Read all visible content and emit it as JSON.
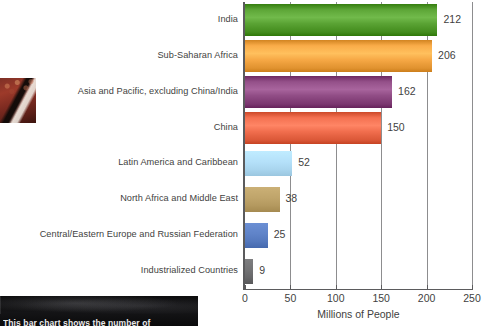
{
  "chart_data": {
    "type": "bar",
    "orientation": "horizontal",
    "title": "",
    "xlabel": "Millions of People",
    "ylabel": "",
    "xlim": [
      0,
      250
    ],
    "xticks": [
      0,
      50,
      100,
      150,
      200,
      250
    ],
    "grid": "vertical",
    "legend": "none",
    "categories": [
      "India",
      "Sub-Saharan Africa",
      "Asia and Pacific, excluding China/India",
      "China",
      "Latin America and Caribbean",
      "North Africa and Middle East",
      "Central/Eastern Europe and Russian Federation",
      "Industrialized Countries"
    ],
    "values": [
      212,
      206,
      162,
      150,
      52,
      38,
      25,
      9
    ],
    "value_labels": [
      "212",
      "206",
      "162",
      "150",
      "52",
      "38",
      "25",
      "9"
    ],
    "colors": [
      "#57a031",
      "#f4a643",
      "#8e4a83",
      "#ee6b4b",
      "#b0dcf5",
      "#bba066",
      "#5b7fc4",
      "#6e6e70"
    ]
  },
  "caption": {
    "text": "This bar chart shows the number of"
  },
  "icons": {
    "photo_left": "photo-thumbnail",
    "photo_bottom": "photo-thumbnail"
  }
}
